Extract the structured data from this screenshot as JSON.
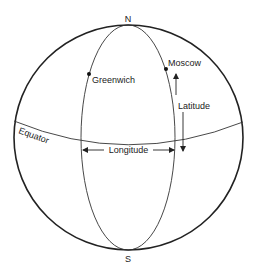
{
  "diagram": {
    "poles": {
      "north": "N",
      "south": "S"
    },
    "points": [
      {
        "name": "Greenwich"
      },
      {
        "name": "Moscow"
      }
    ],
    "labels": {
      "equator": "Equator",
      "longitude": "Longitude",
      "latitude": "Latitude"
    },
    "colors": {
      "line": "#222222",
      "background": "#ffffff"
    }
  }
}
